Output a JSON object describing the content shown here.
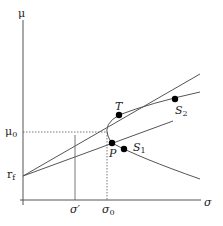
{
  "diagram": {
    "axes": {
      "y_label": "μ",
      "x_label": "σ"
    },
    "labels": {
      "rf": "r",
      "rf_sub": "f",
      "mu0": "μ",
      "mu0_sub": "0",
      "sigma_prime": "σ′",
      "sigma0": "σ",
      "sigma0_sub": "0",
      "T": "T",
      "P": "P",
      "S1": "S",
      "S1_sub": "1",
      "S2": "S",
      "S2_sub": "2"
    },
    "points": [
      {
        "name": "T",
        "x": 119,
        "y": 115
      },
      {
        "name": "S2",
        "x": 175,
        "y": 99
      },
      {
        "name": "P",
        "x": 112,
        "y": 143
      },
      {
        "name": "S1",
        "x": 124,
        "y": 149
      }
    ],
    "colors": {
      "line": "#555555",
      "point": "#000000",
      "text": "#222222"
    }
  }
}
